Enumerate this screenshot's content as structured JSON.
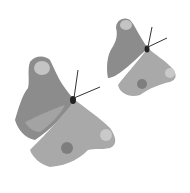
{
  "image": {
    "subject": "Two grayscale butterflies (peacock-style) in flight",
    "background": "#ffffff",
    "colors": {
      "forewing": "#8a8a8a",
      "hindwing": "#a8a8a8",
      "highlight": "#c8c8c8",
      "eyespot": "#bdbdbd",
      "dark_spot": "#7a7a7a",
      "body": "#222222"
    },
    "butterflies": [
      {
        "name": "large",
        "x": 15,
        "y": 55
      },
      {
        "name": "small",
        "x": 105,
        "y": 15
      }
    ]
  }
}
